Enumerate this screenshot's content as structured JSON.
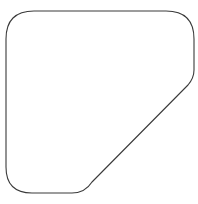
{
  "figure": {
    "background_color": "#ffffff",
    "stroke_color": "#3a3a3a",
    "fill_color": "#ffffff",
    "stroke_width": 1.1,
    "canvas": {
      "width": 198,
      "height": 204
    }
  },
  "shape": {
    "name": "rounded-chamfered-square",
    "description": "Closed outline: square with four rounded corners where the bottom-right corner is replaced by a long diagonal chamfer running from the right edge down to the bottom edge",
    "left_x": 6,
    "right_x": 194,
    "top_y": 11,
    "bottom_y": 193,
    "corner_radius_top_left": 28,
    "corner_radius_top_right": 28,
    "corner_radius_bottom_left": 26,
    "chamfer_start_on_right_edge_y": 70,
    "chamfer_end_on_bottom_edge_x": 72,
    "path": "M 34 11 L 166 11 Q 194 11 194 39 L 194 70 Q 194 78 188 85 L 92 182 Q 85 193 72 193 L 32 193 Q 6 193 6 167 L 6 39 Q 6 11 34 11 Z"
  },
  "caption": {
    "visible_text": "",
    "note": "a faint partially cropped line of grey text is clipped at the very bottom edge"
  }
}
